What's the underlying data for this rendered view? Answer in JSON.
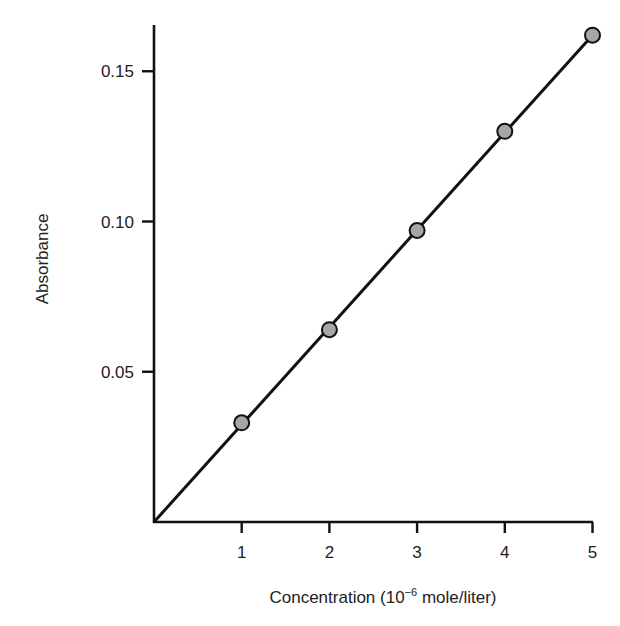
{
  "chart_data": {
    "type": "scatter",
    "title": "",
    "xlabel": "Concentration (10⁻⁶ mole/liter)",
    "ylabel": "Absorbance",
    "x": [
      1,
      2,
      3,
      4,
      5
    ],
    "series": [
      {
        "name": "Absorbance",
        "values": [
          0.033,
          0.064,
          0.097,
          0.13,
          0.162
        ],
        "marker": "circle",
        "marker_fill": "#a6a6a6",
        "marker_edge": "#111111"
      }
    ],
    "fit_line": {
      "type": "linear",
      "from": [
        0,
        0
      ],
      "to": [
        5,
        0.162
      ],
      "color": "#111111"
    },
    "xlim": [
      0,
      5
    ],
    "ylim": [
      0,
      0.165
    ],
    "xticks": [
      1,
      2,
      3,
      4,
      5
    ],
    "xtick_labels": [
      "1",
      "2",
      "3",
      "4",
      "5"
    ],
    "yticks": [
      0.05,
      0.1,
      0.15
    ],
    "ytick_labels": [
      "0.05",
      "0.10",
      "0.15"
    ],
    "grid": false,
    "legend": null
  },
  "axes": {
    "x_title_main": "Concentration (10",
    "x_title_sup": "−6",
    "x_title_end": " mole/liter)",
    "y_title": "Absorbance"
  }
}
